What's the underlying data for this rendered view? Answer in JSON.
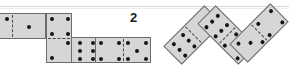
{
  "figure": {
    "label": "2",
    "background_color": "#ffffff",
    "tile_fill_color": "#d6d6d6",
    "tile_border_color": "#6b6b6b",
    "pip_color": "#151515",
    "rule_color": "#d8d8d8"
  },
  "left_group": {
    "description": "chain of dominoes laid flat, partially cropped at the left edge",
    "dominoes": [
      {
        "id": "left-domino-1",
        "orientation": "horizontal",
        "cropped": true,
        "values": [
          2,
          1
        ],
        "faces": [
          {
            "name": "two",
            "pips": 2
          },
          {
            "name": "one",
            "pips": 1
          }
        ]
      },
      {
        "id": "left-domino-2",
        "orientation": "vertical",
        "cropped": false,
        "values": [
          4,
          2
        ],
        "faces": [
          {
            "name": "four",
            "pips": 4
          },
          {
            "name": "two",
            "pips": 2
          }
        ]
      },
      {
        "id": "left-domino-3",
        "orientation": "horizontal",
        "cropped": false,
        "values": [
          6,
          6
        ],
        "faces": [
          {
            "name": "six",
            "pips": 6
          },
          {
            "name": "six",
            "pips": 6
          }
        ]
      },
      {
        "id": "left-domino-4",
        "orientation": "horizontal",
        "cropped": false,
        "values": [
          2,
          5
        ],
        "faces": [
          {
            "name": "two",
            "pips": 2
          },
          {
            "name": "five",
            "pips": 5
          }
        ]
      }
    ]
  },
  "right_group": {
    "description": "three dominoes rotated roughly 45 degrees forming a zig-zag chain",
    "dominoes": [
      {
        "id": "right-domino-1",
        "rotation_deg": -45,
        "values": [
          6,
          1
        ],
        "faces": [
          {
            "name": "six",
            "pips": 6
          },
          {
            "name": "one",
            "pips": 1
          }
        ]
      },
      {
        "id": "right-domino-2",
        "rotation_deg": 45,
        "values": [
          6,
          5
        ],
        "faces": [
          {
            "name": "six",
            "pips": 6
          },
          {
            "name": "five",
            "pips": 5
          }
        ]
      },
      {
        "id": "right-domino-3",
        "rotation_deg": -45,
        "values": [
          3,
          4
        ],
        "faces": [
          {
            "name": "three",
            "pips": 3
          },
          {
            "name": "four",
            "pips": 4
          }
        ]
      }
    ]
  }
}
